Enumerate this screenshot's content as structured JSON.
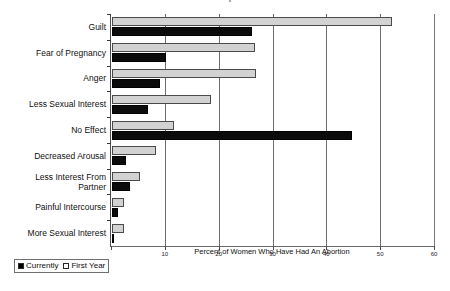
{
  "chart_data": {
    "type": "bar",
    "orientation": "horizontal",
    "title": "Sexual Side Effects Reported After Abortion",
    "title_clipped": true,
    "xlabel": "Percent of Women Who Have Had An Abortion",
    "ylabel": "",
    "xlim": [
      0,
      60
    ],
    "xticks": [
      0,
      10,
      20,
      30,
      40,
      50,
      60
    ],
    "xticklabels": [
      "",
      "10",
      "20",
      "30",
      "40",
      "50",
      "60"
    ],
    "grid": "vertical",
    "legend_position": "bottom-left",
    "categories": [
      "Guilt",
      "Fear of Pregnancy",
      "Anger",
      "Less Sexual Interest",
      "No Effect",
      "Decreased Arousal",
      "Less Interest From\nPartner",
      "Painful Intercourse",
      "More Sexual Interest"
    ],
    "series": [
      {
        "name": "Currently",
        "color": "#000000",
        "values": [
          26.0,
          10.0,
          9.0,
          6.7,
          44.5,
          2.6,
          3.4,
          1.2,
          0.4
        ]
      },
      {
        "name": "First  Year",
        "color": "#d2d2d2",
        "values": [
          52.0,
          26.5,
          26.8,
          18.4,
          11.5,
          8.2,
          5.2,
          2.3,
          2.3
        ]
      }
    ]
  },
  "legend": {
    "entries": [
      {
        "label": "Currently",
        "swatch": "filled-black-square"
      },
      {
        "label": "First  Year",
        "swatch": "open-white-square"
      }
    ]
  },
  "colors": {
    "bar_currently": "#000000",
    "bar_first_year": "#d2d2d2",
    "axis": "#4d4d4d",
    "grid": "#6e6e6e",
    "text": "#111111",
    "background": "#ffffff"
  }
}
